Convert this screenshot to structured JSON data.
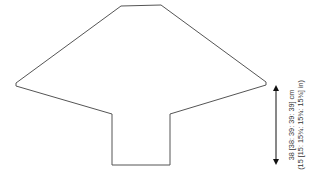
{
  "diagram": {
    "type": "garment schematic (sleeve/body piece outline)",
    "measurement": {
      "cm_label": "38 [38: 39: 39: 39] cm",
      "in_label": "(15 [15: 15¾: 15¾: 15¾] in)"
    },
    "colors": {
      "outline": "#555555",
      "arrow": "#111111",
      "text": "#333333"
    }
  }
}
